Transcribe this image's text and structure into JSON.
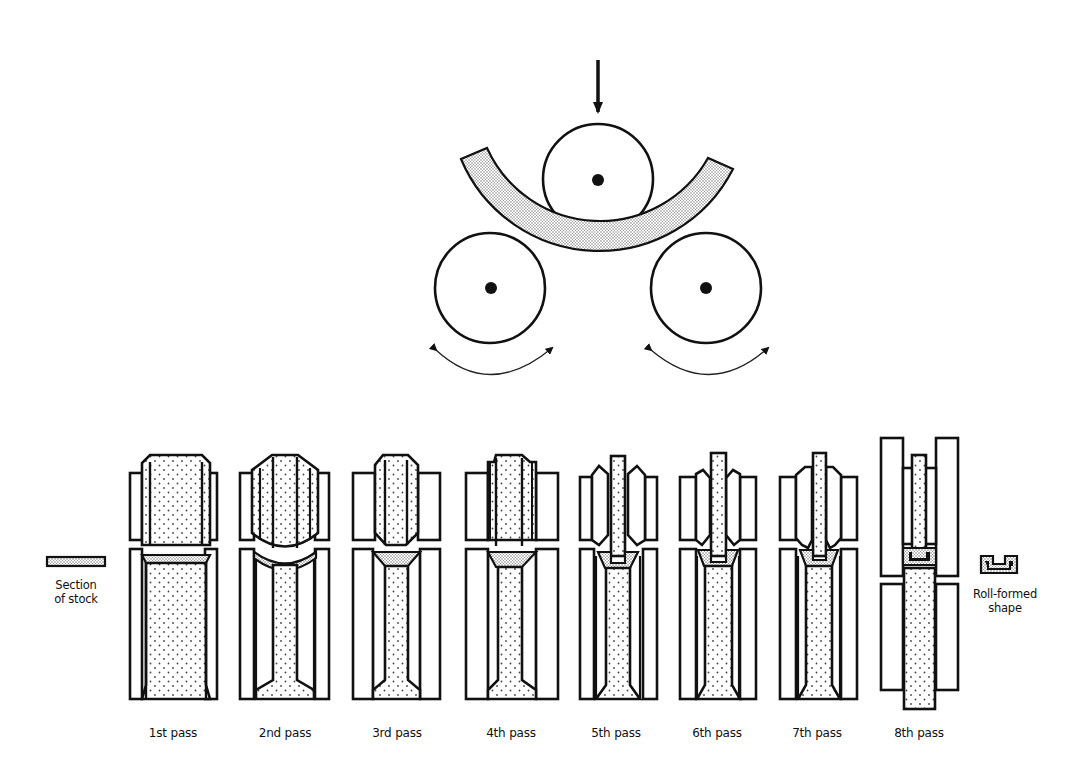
{
  "diagram": {
    "top_section": {
      "name": "three-roll-bending",
      "rolls": [
        {
          "id": "top-roll",
          "cx": 598,
          "cy": 179,
          "r": 55
        },
        {
          "id": "left-roll",
          "cx": 490,
          "cy": 288,
          "r": 55
        },
        {
          "id": "right-roll",
          "cx": 706,
          "cy": 288,
          "r": 55
        }
      ],
      "force_arrow": "downward",
      "rotation_arrows": [
        "left-roll-rotation",
        "right-roll-rotation"
      ]
    },
    "stock_label": {
      "line1": "Section",
      "line2": "of stock"
    },
    "result_label": {
      "line1": "Roll-formed",
      "line2": "shape"
    },
    "passes": [
      {
        "label": "1st pass"
      },
      {
        "label": "2nd pass"
      },
      {
        "label": "3rd pass"
      },
      {
        "label": "4th pass"
      },
      {
        "label": "5th pass"
      },
      {
        "label": "6th pass"
      },
      {
        "label": "7th pass"
      },
      {
        "label": "8th pass"
      }
    ],
    "colors": {
      "line": "#111111",
      "background": "#ffffff",
      "stipple": "#555555"
    }
  }
}
